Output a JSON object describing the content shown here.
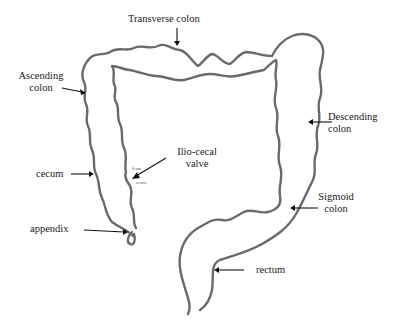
{
  "diagram": {
    "labels": {
      "transverse_colon": "Transverse colon",
      "ascending_colon_line1": "Ascending",
      "ascending_colon_line2": "colon",
      "descending_colon_line1": "Descending",
      "descending_colon_line2": "colon",
      "ilio_cecal_valve_line1": "Ilio-cecal",
      "ilio_cecal_valve_line2": "valve",
      "cecum": "cecum",
      "appendix": "appendix",
      "sigmoid_colon_line1": "Sigmoid",
      "sigmoid_colon_line2": "colon",
      "rectum": "rectum"
    },
    "colors": {
      "outline": "#6a6a6a",
      "text": "#1a1a1a",
      "background": "#ffffff"
    }
  }
}
